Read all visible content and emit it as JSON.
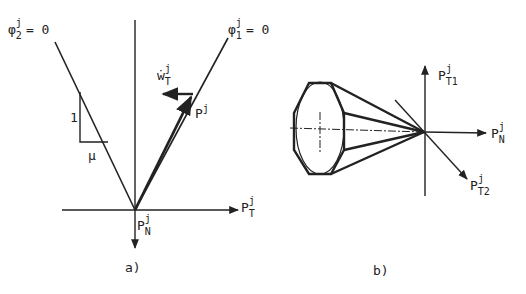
{
  "panel_a": {
    "caption": "a)",
    "cone_left_label": {
      "base": "φ",
      "sub": "2",
      "sup": "j",
      "eq": "= 0"
    },
    "cone_right_label": {
      "base": "φ",
      "sub": "1",
      "sup": "j",
      "eq": "= 0"
    },
    "slip_velocity_label": {
      "base": "ẇ",
      "sub": "T",
      "sup": "j"
    },
    "force_label": {
      "base": "P",
      "sup": "j"
    },
    "tangential_axis_label": {
      "base": "P",
      "sub": "T",
      "sup": "j"
    },
    "normal_axis_label": {
      "base": "P",
      "sub": "N",
      "sup": "j"
    },
    "slope_rise_label": "1",
    "slope_run_label": "μ"
  },
  "panel_b": {
    "caption": "b)",
    "t1_axis_label": {
      "base": "P",
      "sub": "T1",
      "sup": "j"
    },
    "normal_axis_label": {
      "base": "P",
      "sub": "N",
      "sup": "j"
    },
    "t2_axis_label": {
      "base": "P",
      "sub": "T2",
      "sup": "j"
    }
  },
  "colors": {
    "ink": "#222222",
    "background": "#ffffff"
  }
}
